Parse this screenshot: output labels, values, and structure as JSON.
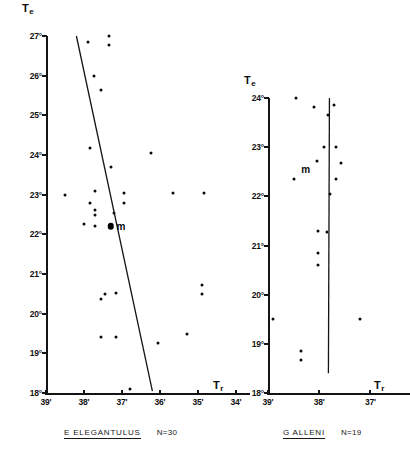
{
  "figure": {
    "panels": [
      {
        "id": "left",
        "species_label": "E  ELEGANTULUS",
        "sample_size_label": "N=30",
        "y_axis_title": "T",
        "y_axis_subscript": "e",
        "x_axis_title": "T",
        "x_axis_subscript": "r",
        "y_ticks": [
          "27°",
          "26°",
          "25°",
          "24°",
          "23°",
          "22°",
          "21°",
          "20°",
          "19°",
          "18°"
        ],
        "x_ticks": [
          "39'",
          "38'",
          "37'",
          "36'",
          "35'",
          "34'"
        ],
        "mean_label": "m"
      },
      {
        "id": "right",
        "species_label": "G  ALLENI",
        "sample_size_label": "N=19",
        "y_axis_title": "T",
        "y_axis_subscript": "e",
        "x_axis_title": "T",
        "x_axis_subscript": "r",
        "y_ticks": [
          "24°",
          "23°",
          "22°",
          "21°",
          "20°",
          "19°",
          "18°"
        ],
        "x_ticks": [
          "39'",
          "38'",
          "37'"
        ],
        "mean_label": "m"
      }
    ]
  },
  "chart_data": [
    {
      "type": "scatter",
      "title": "E ELEGANTULUS",
      "subtitle": "N=30",
      "xlabel": "Tr",
      "ylabel": "Te",
      "xlim": [
        39.0,
        34.0
      ],
      "ylim": [
        18.0,
        27.0
      ],
      "x_tick_values": [
        39,
        38,
        37,
        36,
        35,
        34
      ],
      "x_tick_labels": [
        "39'",
        "38'",
        "37'",
        "36'",
        "35'",
        "34'"
      ],
      "y_tick_values": [
        18,
        19,
        20,
        21,
        22,
        23,
        24,
        25,
        26,
        27
      ],
      "y_tick_labels": [
        "18°",
        "19°",
        "20°",
        "21°",
        "22°",
        "23°",
        "24°",
        "25°",
        "26°",
        "27°"
      ],
      "grid": false,
      "legend": false,
      "points": [
        {
          "x": 37.9,
          "y": 26.85
        },
        {
          "x": 37.35,
          "y": 27.0
        },
        {
          "x": 37.35,
          "y": 26.78
        },
        {
          "x": 37.75,
          "y": 26.0
        },
        {
          "x": 37.55,
          "y": 25.65
        },
        {
          "x": 37.85,
          "y": 24.18
        },
        {
          "x": 36.25,
          "y": 24.05
        },
        {
          "x": 37.3,
          "y": 23.7
        },
        {
          "x": 37.7,
          "y": 23.1
        },
        {
          "x": 38.5,
          "y": 23.0
        },
        {
          "x": 36.95,
          "y": 23.05
        },
        {
          "x": 36.95,
          "y": 22.8
        },
        {
          "x": 35.65,
          "y": 23.05
        },
        {
          "x": 34.85,
          "y": 23.05
        },
        {
          "x": 37.85,
          "y": 22.8
        },
        {
          "x": 37.72,
          "y": 22.62
        },
        {
          "x": 37.72,
          "y": 22.48
        },
        {
          "x": 37.22,
          "y": 22.55
        },
        {
          "x": 38.0,
          "y": 22.25
        },
        {
          "x": 37.72,
          "y": 22.2
        },
        {
          "x": 34.9,
          "y": 20.72
        },
        {
          "x": 34.9,
          "y": 20.5
        },
        {
          "x": 37.45,
          "y": 20.5
        },
        {
          "x": 37.15,
          "y": 20.52
        },
        {
          "x": 37.55,
          "y": 20.38
        },
        {
          "x": 37.55,
          "y": 19.4
        },
        {
          "x": 37.15,
          "y": 19.4
        },
        {
          "x": 36.05,
          "y": 19.25
        },
        {
          "x": 35.3,
          "y": 19.5
        },
        {
          "x": 36.8,
          "y": 18.1
        }
      ],
      "mean_point": {
        "x": 37.3,
        "y": 22.2,
        "label": "m"
      },
      "regression_line": {
        "x0": 38.2,
        "y0": 27.0,
        "x1": 36.2,
        "y1": 18.05
      }
    },
    {
      "type": "scatter",
      "title": "G ALLENI",
      "subtitle": "N=19",
      "xlabel": "Tr",
      "ylabel": "Te",
      "xlim": [
        39.0,
        36.5
      ],
      "ylim": [
        18.0,
        24.0
      ],
      "x_tick_values": [
        39,
        38,
        37
      ],
      "x_tick_labels": [
        "39'",
        "38'",
        "37'"
      ],
      "y_tick_values": [
        18,
        19,
        20,
        21,
        22,
        23,
        24
      ],
      "y_tick_labels": [
        "18°",
        "19°",
        "20°",
        "21°",
        "22°",
        "23°",
        "24°"
      ],
      "grid": false,
      "legend": false,
      "points": [
        {
          "x": 38.45,
          "y": 24.0
        },
        {
          "x": 38.1,
          "y": 23.82
        },
        {
          "x": 37.72,
          "y": 23.85
        },
        {
          "x": 37.82,
          "y": 23.65
        },
        {
          "x": 37.9,
          "y": 23.0
        },
        {
          "x": 37.68,
          "y": 23.0
        },
        {
          "x": 38.05,
          "y": 22.72
        },
        {
          "x": 37.58,
          "y": 22.68
        },
        {
          "x": 37.68,
          "y": 22.35
        },
        {
          "x": 38.5,
          "y": 22.35
        },
        {
          "x": 37.78,
          "y": 22.05
        },
        {
          "x": 38.02,
          "y": 21.3
        },
        {
          "x": 37.85,
          "y": 21.28
        },
        {
          "x": 38.02,
          "y": 20.85
        },
        {
          "x": 38.02,
          "y": 20.6
        },
        {
          "x": 37.2,
          "y": 19.5
        },
        {
          "x": 38.35,
          "y": 18.85
        },
        {
          "x": 38.35,
          "y": 18.68
        },
        {
          "x": 38.9,
          "y": 19.5
        }
      ],
      "mean_point": {
        "x": 38.0,
        "y": 22.55,
        "label": "m"
      },
      "regression_line": {
        "x0": 37.8,
        "y0": 24.0,
        "x1": 37.82,
        "y1": 18.4
      }
    }
  ]
}
